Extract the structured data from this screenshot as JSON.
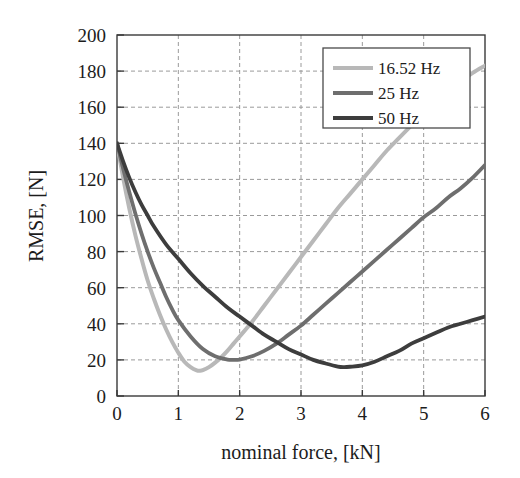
{
  "chart_data": {
    "type": "line",
    "title": "",
    "xlabel": "nominal force, [kN]",
    "ylabel": "RMSE, [N]",
    "xlim": [
      0,
      6
    ],
    "ylim": [
      0,
      200
    ],
    "xticks": [
      "0",
      "1",
      "2",
      "3",
      "4",
      "5",
      "6"
    ],
    "yticks": [
      "0",
      "20",
      "40",
      "60",
      "80",
      "100",
      "120",
      "140",
      "160",
      "180",
      "200"
    ],
    "xtick_values": [
      0,
      1,
      2,
      3,
      4,
      5,
      6
    ],
    "ytick_values": [
      0,
      20,
      40,
      60,
      80,
      100,
      120,
      140,
      160,
      180,
      200
    ],
    "grid": true,
    "grid_style": "dashed",
    "legend_position": "upper right",
    "series": [
      {
        "name": "16.52 Hz",
        "color": "#b8b8b8",
        "x": [
          0,
          0.1,
          0.2,
          0.3,
          0.4,
          0.5,
          0.6,
          0.7,
          0.8,
          0.9,
          1.0,
          1.1,
          1.2,
          1.3,
          1.35,
          1.4,
          1.5,
          1.6,
          1.7,
          1.8,
          1.9,
          2.0,
          2.2,
          2.4,
          2.6,
          2.8,
          3.0,
          3.2,
          3.4,
          3.6,
          3.8,
          4.0,
          4.2,
          4.4,
          4.6,
          4.8,
          5.0,
          5.2,
          5.4,
          5.6,
          5.8,
          6.0
        ],
        "y": [
          140,
          121,
          104,
          89,
          76,
          64,
          54,
          45,
          37,
          30,
          24,
          19,
          16,
          14.2,
          14,
          14.3,
          16,
          18.5,
          21.5,
          25,
          29,
          33,
          41,
          50,
          59,
          68,
          77,
          86,
          95,
          104,
          112,
          120,
          128,
          136,
          143,
          150,
          157,
          163,
          169,
          174,
          179,
          183
        ]
      },
      {
        "name": "25 Hz",
        "color": "#6e6e6e",
        "x": [
          0,
          0.1,
          0.2,
          0.3,
          0.4,
          0.5,
          0.6,
          0.7,
          0.8,
          0.9,
          1.0,
          1.2,
          1.4,
          1.6,
          1.8,
          1.9,
          2.0,
          2.2,
          2.4,
          2.6,
          2.8,
          3.0,
          3.2,
          3.4,
          3.6,
          3.8,
          4.0,
          4.2,
          4.4,
          4.6,
          4.8,
          5.0,
          5.2,
          5.4,
          5.6,
          5.8,
          6.0
        ],
        "y": [
          140,
          126,
          113,
          101,
          90,
          80,
          71,
          63,
          55,
          48,
          42,
          33,
          26,
          22,
          20.2,
          20,
          20.2,
          22,
          25,
          29,
          34,
          39,
          45,
          51,
          57,
          63,
          69,
          75,
          81,
          87,
          93,
          99,
          104,
          110,
          115,
          121,
          128
        ]
      },
      {
        "name": "50 Hz",
        "color": "#3d3d3d",
        "x": [
          0,
          0.1,
          0.2,
          0.3,
          0.4,
          0.5,
          0.6,
          0.8,
          1.0,
          1.2,
          1.4,
          1.6,
          1.8,
          2.0,
          2.2,
          2.4,
          2.6,
          2.8,
          3.0,
          3.2,
          3.4,
          3.6,
          3.7,
          3.8,
          4.0,
          4.2,
          4.4,
          4.6,
          4.8,
          5.0,
          5.2,
          5.4,
          5.6,
          5.8,
          6.0
        ],
        "y": [
          140,
          130,
          121,
          113,
          106,
          100,
          94,
          84,
          76,
          68,
          61,
          55,
          49,
          44,
          39,
          34,
          30,
          26,
          23,
          20,
          18,
          16.3,
          16,
          16.2,
          17,
          19,
          22,
          25,
          29,
          32,
          35,
          38,
          40,
          42,
          44
        ]
      }
    ]
  },
  "legend": {
    "entries": [
      {
        "label": "16.52 Hz",
        "color": "#b8b8b8"
      },
      {
        "label": "25 Hz",
        "color": "#6e6e6e"
      },
      {
        "label": "50 Hz",
        "color": "#3d3d3d"
      }
    ]
  },
  "axes": {
    "x_title": "nominal force, [kN]",
    "y_title": "RMSE, [N]"
  },
  "colors": {
    "axis": "#3a3a3a",
    "grid": "#9a9a9a",
    "background": "#ffffff",
    "text": "#1c1c1c"
  }
}
